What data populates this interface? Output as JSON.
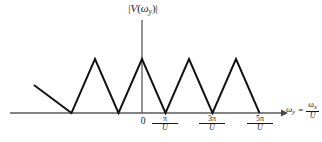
{
  "figure": {
    "y_axis_label": "|V(ωy)|",
    "y_axis_label_parts": {
      "open_bar": "|",
      "v": "V",
      "open_paren": "(",
      "omega": "ω",
      "subscript": "y",
      "close_paren": ")",
      "close_bar": "|"
    },
    "x_axis_label_parts": {
      "omega": "ω",
      "subscript": "y",
      "equals": "=",
      "numerator_omega": "ω",
      "numerator_subscript": "x",
      "denominator": "U"
    },
    "origin_label": "0",
    "ticks": [
      {
        "numerator": "π",
        "denominator": "U"
      },
      {
        "numerator": "3π",
        "denominator": "U"
      },
      {
        "numerator": "5π",
        "denominator": "U"
      }
    ],
    "colors": {
      "ink": "#1a1a1a",
      "axis": "#555555",
      "background": "#ffffff"
    }
  },
  "chart_data": {
    "type": "line",
    "title": "",
    "xlabel": "ωy = ωx/U",
    "ylabel": "|V(ωy)|",
    "grid": false,
    "legend": null,
    "xlim": [
      -4.6,
      6.6
    ],
    "ylim": [
      0,
      1.15
    ],
    "x_tick_values": [
      0,
      1,
      3,
      5
    ],
    "x_tick_labels": [
      "0",
      "π/U",
      "3π/U",
      "5π/U"
    ],
    "x_units": "π/U",
    "peak_value": 1,
    "series": [
      {
        "name": "|V(ωy)|",
        "x": [
          -4.6,
          -3,
          -2,
          -1,
          0,
          1,
          2,
          3,
          4,
          5
        ],
        "y": [
          0.52,
          0,
          1,
          0,
          1,
          0,
          1,
          0,
          1,
          0
        ]
      }
    ],
    "peaks_x": [
      -2,
      0,
      2,
      4
    ],
    "zeros_x": [
      -3,
      -1,
      1,
      3,
      5
    ]
  },
  "geometry": {
    "axis_y_px": 113,
    "axis_x_px": 142,
    "axis_left_px": 10,
    "axis_right_px": 284,
    "axis_top_px": 20,
    "peak_y_px": 59,
    "zeros_px": [
      70,
      118,
      165,
      212,
      260
    ],
    "peaks_px": [
      95,
      142,
      189,
      236
    ],
    "partial_start_px": [
      58,
      88
    ]
  }
}
